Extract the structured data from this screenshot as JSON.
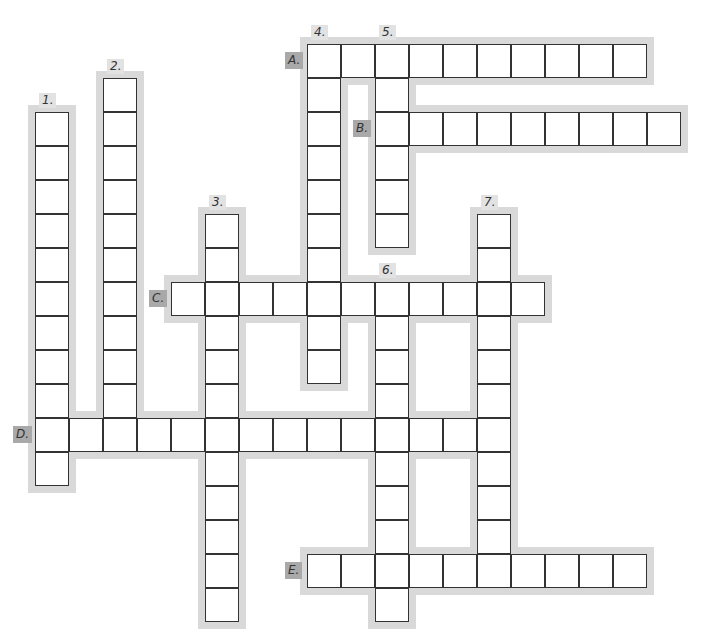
{
  "puzzle": {
    "cell_size": 34,
    "origin_x": 35,
    "origin_y": 44,
    "colors": {
      "cell_border": "#333333",
      "halo": "#d9d9d9",
      "label_bg": "#a9a9a9",
      "number_bg": "#e2e2e2"
    },
    "down": [
      {
        "label": "1.",
        "col": 0,
        "row": 2,
        "length": 11
      },
      {
        "label": "2.",
        "col": 2,
        "row": 1,
        "length": 11
      },
      {
        "label": "3.",
        "col": 5,
        "row": 5,
        "length": 12
      },
      {
        "label": "4.",
        "col": 8,
        "row": 0,
        "length": 10
      },
      {
        "label": "5.",
        "col": 10,
        "row": 0,
        "length": 6
      },
      {
        "label": "6.",
        "col": 10,
        "row": 7,
        "length": 10
      },
      {
        "label": "7.",
        "col": 13,
        "row": 5,
        "length": 11
      }
    ],
    "across": [
      {
        "label": "A.",
        "col": 8,
        "row": 0,
        "length": 10
      },
      {
        "label": "B.",
        "col": 10,
        "row": 2,
        "length": 9
      },
      {
        "label": "C.",
        "col": 4,
        "row": 7,
        "length": 11
      },
      {
        "label": "D.",
        "col": 0,
        "row": 11,
        "length": 14
      },
      {
        "label": "E.",
        "col": 8,
        "row": 15,
        "length": 10
      }
    ]
  }
}
